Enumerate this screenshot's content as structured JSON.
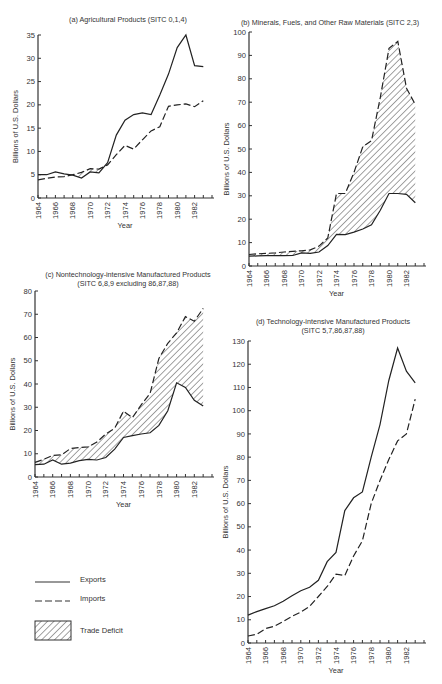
{
  "legend": {
    "items": [
      {
        "label": "Exports",
        "style": "solid"
      },
      {
        "label": "Imports",
        "style": "dashed"
      },
      {
        "label": "Trade Deficit",
        "style": "hatched"
      }
    ]
  },
  "chart_data": [
    {
      "id": "a",
      "type": "line",
      "title": "(a) Agricultural Products (SITC 0,1,4)",
      "subtitle": "",
      "xlabel": "Year",
      "ylabel": "Billions of U.S. Dollars",
      "ylim": [
        0,
        35
      ],
      "yticks": [
        0,
        5,
        10,
        15,
        20,
        25,
        30,
        35
      ],
      "xticks": [
        1964,
        1966,
        1968,
        1970,
        1972,
        1974,
        1976,
        1978,
        1980,
        1982
      ],
      "x": [
        1964,
        1965,
        1966,
        1967,
        1968,
        1969,
        1970,
        1971,
        1972,
        1973,
        1974,
        1975,
        1976,
        1977,
        1978,
        1979,
        1980,
        1981,
        1982,
        1983
      ],
      "series": [
        {
          "name": "Exports",
          "values": [
            5.0,
            5.0,
            5.6,
            5.2,
            4.9,
            4.3,
            5.6,
            5.4,
            7.6,
            13.5,
            16.7,
            17.9,
            18.3,
            17.9,
            22.1,
            26.6,
            32.3,
            35.0,
            28.4,
            28.2
          ]
        },
        {
          "name": "Imports",
          "values": [
            3.9,
            4.2,
            4.5,
            4.6,
            5.0,
            5.5,
            6.3,
            6.2,
            7.1,
            9.3,
            11.3,
            10.5,
            12.5,
            14.4,
            15.3,
            19.7,
            20.0,
            20.2,
            19.6,
            20.9
          ]
        }
      ],
      "hatched_deficit": "where imports exceed exports (1968-1971)",
      "grid": false
    },
    {
      "id": "b",
      "type": "area",
      "title": "(b) Minerals, Fuels, and Other Raw Materials (SITC 2,3)",
      "subtitle": "",
      "xlabel": "Year",
      "ylabel": "Billions of U.S. Dollars",
      "ylim": [
        0,
        100
      ],
      "yticks": [
        0,
        10,
        20,
        30,
        40,
        50,
        60,
        70,
        80,
        90,
        100
      ],
      "xticks": [
        1964,
        1966,
        1968,
        1970,
        1972,
        1974,
        1976,
        1978,
        1980,
        1982
      ],
      "x": [
        1964,
        1965,
        1966,
        1967,
        1968,
        1969,
        1970,
        1971,
        1972,
        1973,
        1974,
        1975,
        1976,
        1977,
        1978,
        1979,
        1980,
        1981,
        1982,
        1983
      ],
      "series": [
        {
          "name": "Exports",
          "values": [
            4.2,
            4.3,
            4.4,
            4.4,
            4.4,
            4.5,
            5.6,
            5.4,
            6.0,
            8.7,
            13.5,
            13.4,
            14.5,
            15.8,
            17.6,
            23.8,
            31.0,
            31.0,
            30.6,
            27.0
          ]
        },
        {
          "name": "Imports",
          "values": [
            4.9,
            5.2,
            5.4,
            5.6,
            6.0,
            6.3,
            6.5,
            6.9,
            8.5,
            12.0,
            31.0,
            31.0,
            40.0,
            51.0,
            53.5,
            72.0,
            93.0,
            96.0,
            76.0,
            69.0
          ]
        }
      ],
      "hatched_deficit": "area between imports and exports",
      "grid": false
    },
    {
      "id": "c",
      "type": "area",
      "title": "(c) Nontechnology-intensive Manufactured Products",
      "subtitle": "(SITC 6,8,9 excluding 86,87,88)",
      "xlabel": "Year",
      "ylabel": "Billions of U.S. Dollars",
      "ylim": [
        0,
        80
      ],
      "yticks": [
        0,
        10,
        20,
        30,
        40,
        50,
        60,
        70,
        80
      ],
      "xticks": [
        1964,
        1966,
        1968,
        1970,
        1972,
        1974,
        1976,
        1978,
        1980,
        1982
      ],
      "x": [
        1964,
        1965,
        1966,
        1967,
        1968,
        1969,
        1970,
        1971,
        1972,
        1973,
        1974,
        1975,
        1976,
        1977,
        1978,
        1979,
        1980,
        1981,
        1982,
        1983
      ],
      "series": [
        {
          "name": "Exports",
          "values": [
            5.3,
            5.5,
            7.3,
            5.5,
            6.0,
            7.0,
            7.6,
            7.3,
            8.4,
            12.0,
            17.0,
            17.8,
            18.5,
            19.0,
            22.2,
            28.5,
            40.5,
            38.5,
            33.0,
            30.5
          ]
        },
        {
          "name": "Imports",
          "values": [
            6.3,
            7.6,
            9.3,
            9.5,
            12.2,
            12.7,
            13.0,
            15.0,
            18.5,
            21.0,
            28.3,
            25.5,
            31.0,
            36.0,
            51.0,
            57.5,
            62.0,
            69.0,
            67.0,
            72.5
          ]
        }
      ],
      "hatched_deficit": "area between imports and exports",
      "grid": false
    },
    {
      "id": "d",
      "type": "line",
      "title": "(d) Technology-intensive Manufactured Products",
      "subtitle": "(SITC 5,7,86,87,88)",
      "xlabel": "Year",
      "ylabel": "Billions of U.S. Dollars",
      "ylim": [
        0,
        130
      ],
      "yticks": [
        0,
        10,
        20,
        30,
        40,
        50,
        60,
        70,
        80,
        90,
        100,
        110,
        120,
        130
      ],
      "xticks": [
        1964,
        1966,
        1968,
        1970,
        1972,
        1974,
        1976,
        1978,
        1980,
        1982
      ],
      "x": [
        1964,
        1965,
        1966,
        1967,
        1968,
        1969,
        1970,
        1971,
        1972,
        1973,
        1974,
        1975,
        1976,
        1977,
        1978,
        1979,
        1980,
        1981,
        1982,
        1983
      ],
      "series": [
        {
          "name": "Exports",
          "values": [
            12.0,
            13.5,
            14.8,
            16.0,
            18.0,
            20.3,
            22.5,
            24.0,
            27.0,
            35.0,
            39.0,
            57.0,
            62.5,
            65.0,
            80.0,
            94.0,
            113.0,
            127.0,
            117.0,
            112.0
          ]
        },
        {
          "name": "Imports",
          "values": [
            3.0,
            3.8,
            6.2,
            7.2,
            9.3,
            11.5,
            13.3,
            15.8,
            20.0,
            24.3,
            29.6,
            29.0,
            37.5,
            44.0,
            60.0,
            70.0,
            79.0,
            87.0,
            90.0,
            105.0
          ]
        }
      ],
      "grid": false
    }
  ]
}
